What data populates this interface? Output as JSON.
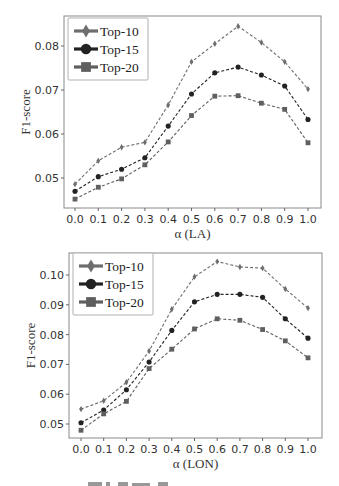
{
  "chart_data": [
    {
      "type": "line",
      "title": "",
      "xlabel": "α (LA)",
      "ylabel": "F1-score",
      "x": [
        0.0,
        0.1,
        0.2,
        0.3,
        0.4,
        0.5,
        0.6,
        0.7,
        0.8,
        0.9,
        1.0
      ],
      "x_tick_labels": [
        "0.0",
        "0.1",
        "0.2",
        "0.3",
        "0.4",
        "0.5",
        "0.6",
        "0.7",
        "0.8",
        "0.9",
        "1.0"
      ],
      "y_ticks": [
        0.05,
        0.06,
        0.07,
        0.08
      ],
      "y_tick_labels": [
        "0.05",
        "0.06",
        "0.07",
        "0.08"
      ],
      "ylim": [
        0.0435,
        0.0875
      ],
      "grid": false,
      "legend_position": "upper left",
      "series": [
        {
          "name": "Top-10",
          "marker": "diamond",
          "color": "#6e6e6e",
          "values": [
            0.0486,
            0.0539,
            0.057,
            0.0581,
            0.0666,
            0.0764,
            0.0805,
            0.0845,
            0.0808,
            0.0764,
            0.0702
          ]
        },
        {
          "name": "Top-15",
          "marker": "circle",
          "color": "#222222",
          "values": [
            0.047,
            0.0503,
            0.052,
            0.0546,
            0.0618,
            0.0691,
            0.0739,
            0.0752,
            0.0734,
            0.0709,
            0.0633
          ]
        },
        {
          "name": "Top-20",
          "marker": "square",
          "color": "#5f5f5f",
          "values": [
            0.0452,
            0.0479,
            0.0498,
            0.053,
            0.0582,
            0.0642,
            0.0686,
            0.0687,
            0.067,
            0.0656,
            0.058
          ]
        }
      ]
    },
    {
      "type": "line",
      "title": "",
      "xlabel": "α (LON)",
      "ylabel": "F1-score",
      "x": [
        0.0,
        0.1,
        0.2,
        0.3,
        0.4,
        0.5,
        0.6,
        0.7,
        0.8,
        0.9,
        1.0
      ],
      "x_tick_labels": [
        "0.0",
        "0.1",
        "0.2",
        "0.3",
        "0.4",
        "0.5",
        "0.6",
        "0.7",
        "0.8",
        "0.9",
        "1.0"
      ],
      "y_ticks": [
        0.05,
        0.06,
        0.07,
        0.08,
        0.09,
        0.1
      ],
      "y_tick_labels": [
        "0.05",
        "0.06",
        "0.07",
        "0.08",
        "0.09",
        "0.10"
      ],
      "ylim": [
        0.0455,
        0.1075
      ],
      "grid": false,
      "legend_position": "upper left",
      "series": [
        {
          "name": "Top-10",
          "marker": "diamond",
          "color": "#6e6e6e",
          "values": [
            0.055,
            0.0578,
            0.064,
            0.0745,
            0.0885,
            0.0994,
            0.1045,
            0.1027,
            0.1023,
            0.0953,
            0.0889
          ]
        },
        {
          "name": "Top-15",
          "marker": "circle",
          "color": "#222222",
          "values": [
            0.0504,
            0.0547,
            0.0615,
            0.0708,
            0.0814,
            0.091,
            0.0935,
            0.0935,
            0.0925,
            0.0853,
            0.0788
          ]
        },
        {
          "name": "Top-20",
          "marker": "square",
          "color": "#5f5f5f",
          "values": [
            0.0479,
            0.0534,
            0.0576,
            0.0686,
            0.0751,
            0.0819,
            0.0853,
            0.0848,
            0.0817,
            0.0779,
            0.0722
          ]
        }
      ]
    }
  ],
  "charts": {
    "top": {
      "ylabel": "F1-score",
      "xlabel": "α (LA)",
      "legend": [
        "Top-10",
        "Top-15",
        "Top-20"
      ]
    },
    "bottom": {
      "ylabel": "F1-score",
      "xlabel": "α (LON)",
      "legend": [
        "Top-10",
        "Top-15",
        "Top-20"
      ]
    }
  }
}
